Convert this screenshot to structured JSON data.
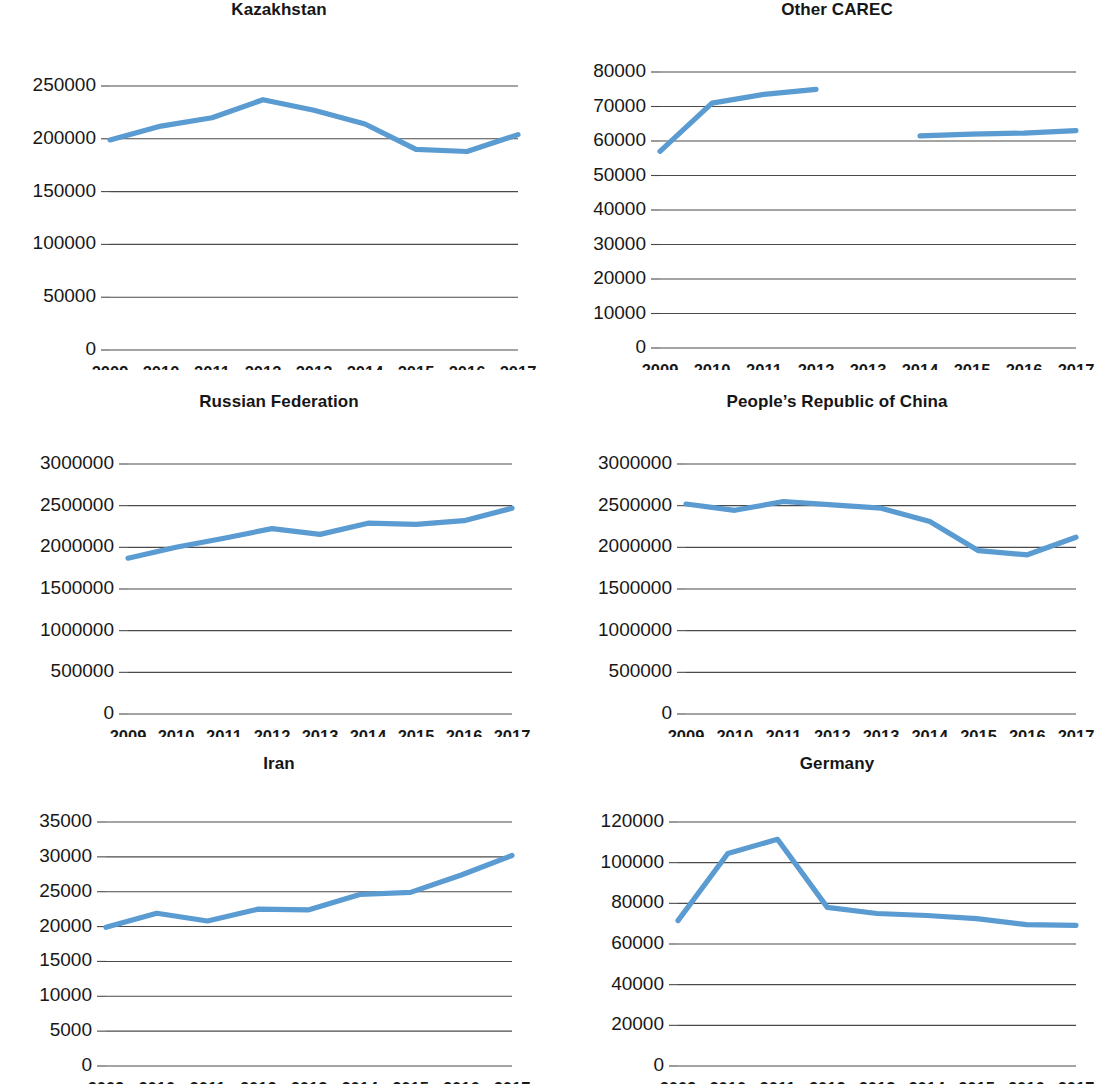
{
  "figure": {
    "line_color": "#5a9bd1",
    "axis_color": "#4a4a4a",
    "text_color": "#181818",
    "background": "#ffffff"
  },
  "panels": [
    {
      "id": "kazakhstan",
      "title": "Kazakhstan",
      "chart_data": {
        "type": "line",
        "title": "Kazakhstan",
        "xlabel": "",
        "ylabel": "",
        "x": [
          2009,
          2010,
          2011,
          2012,
          2013,
          2014,
          2015,
          2016,
          2017
        ],
        "categories": [
          "2009",
          "2010",
          "2011",
          "2012",
          "2013",
          "2014",
          "2015",
          "2016",
          "2017"
        ],
        "values": [
          199000,
          212000,
          220000,
          237000,
          227000,
          214000,
          190000,
          188000,
          204000
        ],
        "ylim": [
          0,
          250000
        ],
        "yticks": [
          0,
          50000,
          100000,
          150000,
          200000,
          250000
        ],
        "ytick_labels": [
          "0",
          "50000",
          "100000",
          "150000",
          "200000",
          "250000"
        ],
        "grid": true,
        "legend": "none"
      }
    },
    {
      "id": "other-carec",
      "title": "Other CAREC",
      "chart_data": {
        "type": "line",
        "title": "Other CAREC",
        "xlabel": "",
        "ylabel": "",
        "x": [
          2009,
          2010,
          2011,
          2012,
          2013,
          2014,
          2015,
          2016,
          2017
        ],
        "categories": [
          "2009",
          "2010",
          "2011",
          "2012",
          "2013",
          "2014",
          "2015",
          "2016",
          "2017"
        ],
        "values": [
          57000,
          71000,
          73500,
          75000,
          null,
          61500,
          62000,
          62300,
          63000
        ],
        "ylim": [
          0,
          80000
        ],
        "yticks": [
          0,
          10000,
          20000,
          30000,
          40000,
          50000,
          60000,
          70000,
          80000
        ],
        "ytick_labels": [
          "0",
          "10000",
          "20000",
          "30000",
          "40000",
          "50000",
          "60000",
          "70000",
          "80000"
        ],
        "grid": true,
        "legend": "none",
        "note": "data gap at 2013"
      }
    },
    {
      "id": "russian-federation",
      "title": "Russian Federation",
      "chart_data": {
        "type": "line",
        "title": "Russian Federation",
        "xlabel": "",
        "ylabel": "",
        "x": [
          2009,
          2010,
          2011,
          2012,
          2013,
          2014,
          2015,
          2016,
          2017
        ],
        "categories": [
          "2009",
          "2010",
          "2011",
          "2012",
          "2013",
          "2014",
          "2015",
          "2016",
          "2017"
        ],
        "values": [
          1870000,
          2000000,
          2110000,
          2225000,
          2155000,
          2290000,
          2275000,
          2320000,
          2470000
        ],
        "ylim": [
          0,
          3000000
        ],
        "yticks": [
          0,
          500000,
          1000000,
          1500000,
          2000000,
          2500000,
          3000000
        ],
        "ytick_labels": [
          "0",
          "500000",
          "1000000",
          "1500000",
          "2000000",
          "2500000",
          "3000000"
        ],
        "grid": true,
        "legend": "none"
      }
    },
    {
      "id": "peoples-republic-of-china",
      "title": "People’s Republic of China",
      "chart_data": {
        "type": "line",
        "title": "People’s Republic of China",
        "xlabel": "",
        "ylabel": "",
        "x": [
          2009,
          2010,
          2011,
          2012,
          2013,
          2014,
          2015,
          2016,
          2017
        ],
        "categories": [
          "2009",
          "2010",
          "2011",
          "2012",
          "2013",
          "2014",
          "2015",
          "2016",
          "2017"
        ],
        "values": [
          2520000,
          2445000,
          2550000,
          2510000,
          2470000,
          2310000,
          1960000,
          1910000,
          2120000
        ],
        "ylim": [
          0,
          3000000
        ],
        "yticks": [
          0,
          500000,
          1000000,
          1500000,
          2000000,
          2500000,
          3000000
        ],
        "ytick_labels": [
          "0",
          "500000",
          "1000000",
          "1500000",
          "2000000",
          "2500000",
          "3000000"
        ],
        "grid": true,
        "legend": "none"
      }
    },
    {
      "id": "iran",
      "title": "Iran",
      "chart_data": {
        "type": "line",
        "title": "Iran",
        "xlabel": "",
        "ylabel": "",
        "x": [
          2009,
          2010,
          2011,
          2012,
          2013,
          2014,
          2015,
          2016,
          2017
        ],
        "categories": [
          "2009",
          "2010",
          "2011",
          "2012",
          "2013",
          "2014",
          "2015",
          "2016",
          "2017"
        ],
        "values": [
          19900,
          21900,
          20800,
          22500,
          22400,
          24600,
          24900,
          27400,
          30200
        ],
        "ylim": [
          0,
          35000
        ],
        "yticks": [
          0,
          5000,
          10000,
          15000,
          20000,
          25000,
          30000,
          35000
        ],
        "ytick_labels": [
          "0",
          "5000",
          "10000",
          "15000",
          "20000",
          "25000",
          "30000",
          "35000"
        ],
        "grid": true,
        "legend": "none"
      }
    },
    {
      "id": "germany",
      "title": "Germany",
      "chart_data": {
        "type": "line",
        "title": "Germany",
        "xlabel": "",
        "ylabel": "",
        "x": [
          2009,
          2010,
          2011,
          2012,
          2013,
          2014,
          2015,
          2016,
          2017
        ],
        "categories": [
          "2009",
          "2010",
          "2011",
          "2012",
          "2013",
          "2014",
          "2015",
          "2016",
          "2017"
        ],
        "values": [
          71500,
          104500,
          111500,
          78000,
          75000,
          74000,
          72500,
          69500,
          69200
        ],
        "ylim": [
          0,
          120000
        ],
        "yticks": [
          0,
          20000,
          40000,
          60000,
          80000,
          100000,
          120000
        ],
        "ytick_labels": [
          "0",
          "20000",
          "40000",
          "60000",
          "80000",
          "100000",
          "120000"
        ],
        "grid": true,
        "legend": "none"
      }
    }
  ]
}
